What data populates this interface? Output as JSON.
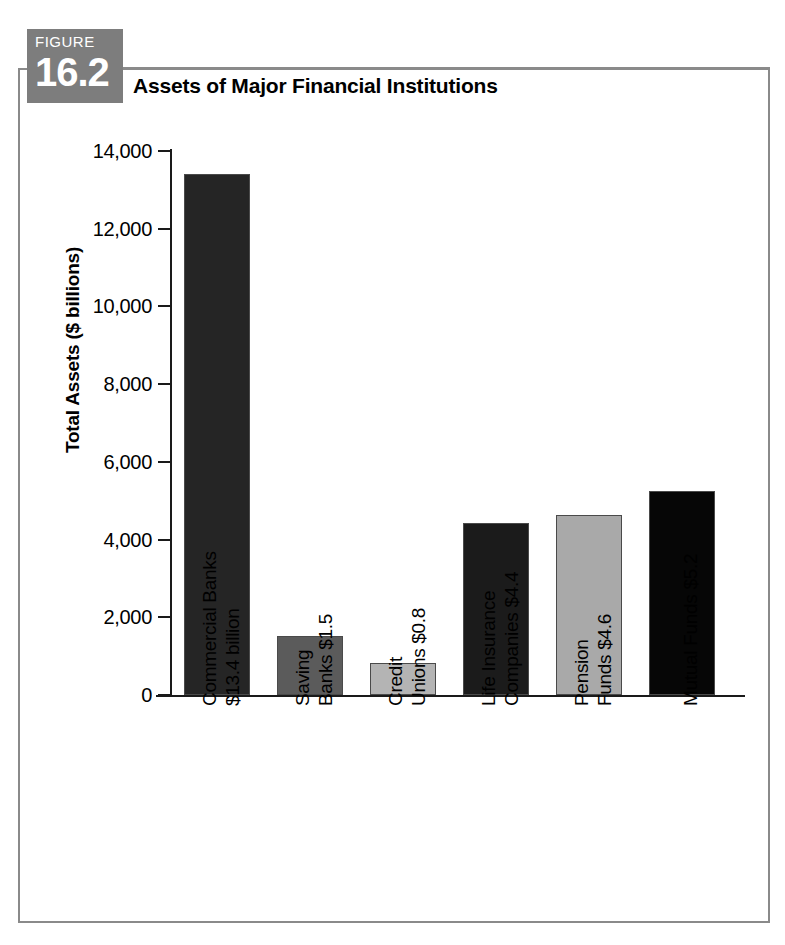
{
  "figure": {
    "badge_word": "FIGURE",
    "badge_number": "16.2",
    "title": "Assets of Major Financial Institutions"
  },
  "axes": {
    "y_title": "Total Assets ($ billions)",
    "y_ticks": [
      "14,000",
      "12,000",
      "10,000",
      "8,000",
      "6,000",
      "4,000",
      "2,000",
      "0"
    ]
  },
  "colors": {
    "badge_gray": "#7d7d7d",
    "frame_gray": "#8a8a8a",
    "axis_black": "#1a1a1a",
    "bar_outline": "#4a4a4a"
  },
  "chart_data": {
    "type": "bar",
    "title": "Assets of Major Financial Institutions",
    "xlabel": "",
    "ylabel": "Total Assets ($ billions)",
    "ylim": [
      0,
      14000
    ],
    "ytick_step": 2000,
    "grid": false,
    "legend": "none",
    "categories": [
      "Commercial Banks $13.4 billion",
      "Saving Banks $1.5",
      "Credit Unions $0.8",
      "Life Insurance Companies $4.4",
      "Pension Funds $4.6",
      "Mutual Funds $5.2"
    ],
    "values": [
      13400,
      1520,
      830,
      4420,
      4640,
      5250
    ],
    "bar_colors": [
      "#252525",
      "#5b5b5b",
      "#b4b4b4",
      "#1b1b1b",
      "#a9a9a9",
      "#060606"
    ],
    "labels": [
      {
        "line1": "Commercial Banks",
        "line2": "$13.4 billion",
        "value": 13400,
        "color": "#252525"
      },
      {
        "line1": "Saving",
        "line2": "Banks $1.5",
        "value": 1520,
        "color": "#5b5b5b"
      },
      {
        "line1": "Credit",
        "line2": "Unions $0.8",
        "value": 830,
        "color": "#b4b4b4"
      },
      {
        "line1": "Life Insurance",
        "line2": "Companies $4.4",
        "value": 4420,
        "color": "#1b1b1b"
      },
      {
        "line1": "Pension",
        "line2": "Funds $4.6",
        "value": 4640,
        "color": "#a9a9a9"
      },
      {
        "line1": "Mutual Funds $5.2",
        "line2": "",
        "value": 5250,
        "color": "#060606"
      }
    ]
  }
}
